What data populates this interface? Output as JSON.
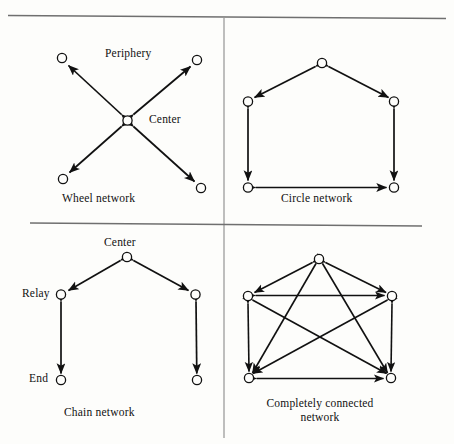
{
  "figure": {
    "background_color": "#fdfdfb",
    "ink_color": "#111111",
    "rule_color": "#6f6f6f",
    "node_fill": "#fdfdfb",
    "node_stroke": "#111111"
  },
  "rules": {
    "top_rule": "horizontal-rule-top",
    "vertical_divider": "vertical-divider",
    "middle_rule": "horizontal-rule-middle"
  },
  "panels": [
    {
      "id": "wheel",
      "caption": "Wheel network",
      "annotations": [
        {
          "name": "periphery-label",
          "text": "Periphery"
        },
        {
          "name": "center-label",
          "text": "Center"
        }
      ],
      "node_count": 5,
      "edge_count": 4,
      "edge_style": "bidirectional"
    },
    {
      "id": "circle",
      "caption": "Circle network",
      "annotations": [],
      "node_count": 5,
      "edge_count": 5,
      "edge_style": "bidirectional"
    },
    {
      "id": "chain",
      "caption": "Chain network",
      "annotations": [
        {
          "name": "center-label",
          "text": "Center"
        },
        {
          "name": "relay-label",
          "text": "Relay"
        },
        {
          "name": "end-label",
          "text": "End"
        }
      ],
      "node_count": 5,
      "edge_count": 4,
      "edge_style": "bidirectional"
    },
    {
      "id": "completely-connected",
      "caption_line1": "Completely connected",
      "caption_line2": "network",
      "caption": "Completely connected network",
      "annotations": [],
      "node_count": 5,
      "edge_count": 10,
      "edge_style": "bidirectional"
    }
  ]
}
